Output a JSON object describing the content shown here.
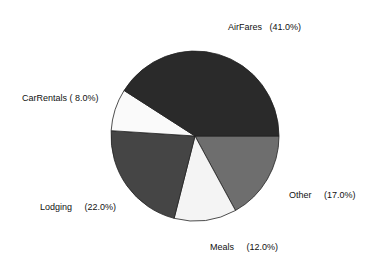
{
  "chart_data": {
    "type": "pie",
    "title": "",
    "center": [
      195,
      136
    ],
    "radius": [
      84,
      85
    ],
    "start_angle_deg": 0,
    "direction": "clockwise",
    "legend": "none",
    "slices": [
      {
        "label": "Other",
        "value": 17.0,
        "display": "(17.0%)",
        "color": "#6e6e6e",
        "label_pos": [
          289,
          191
        ],
        "label_gap": "     "
      },
      {
        "label": "Meals",
        "value": 12.0,
        "display": "(12.0%)",
        "color": "#f4f4f4",
        "label_pos": [
          210,
          243
        ],
        "label_gap": "     "
      },
      {
        "label": "Lodging",
        "value": 22.0,
        "display": "(22.0%)",
        "color": "#454545",
        "label_pos": [
          40,
          203
        ],
        "label_gap": "     "
      },
      {
        "label": "CarRentals",
        "value": 8.0,
        "display": "( 8.0%)",
        "color": "#fafafa",
        "label_pos": [
          22,
          94
        ],
        "label_gap": " "
      },
      {
        "label": "AirFares",
        "value": 41.0,
        "display": "(41.0%)",
        "color": "#2a2a2a",
        "label_pos": [
          228,
          23
        ],
        "label_gap": "   "
      }
    ],
    "outline_color": "#222222"
  }
}
